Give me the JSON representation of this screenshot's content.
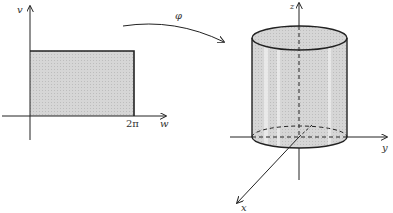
{
  "figure": {
    "domain_panel": {
      "vertical_axis_label": "v",
      "horizontal_axis_label": "w",
      "tick_label": "2π",
      "region": "shaded rectangle 0 ≤ w ≤ 2π"
    },
    "map": {
      "label": "φ"
    },
    "image_panel": {
      "z_axis_label": "z",
      "y_axis_label": "y",
      "x_axis_label": "x",
      "surface": "shaded cylinder around z-axis"
    }
  },
  "colors": {
    "ink": "#222222",
    "fill": "#d4d4d4",
    "highlight": "#ececec",
    "background": "#ffffff"
  }
}
